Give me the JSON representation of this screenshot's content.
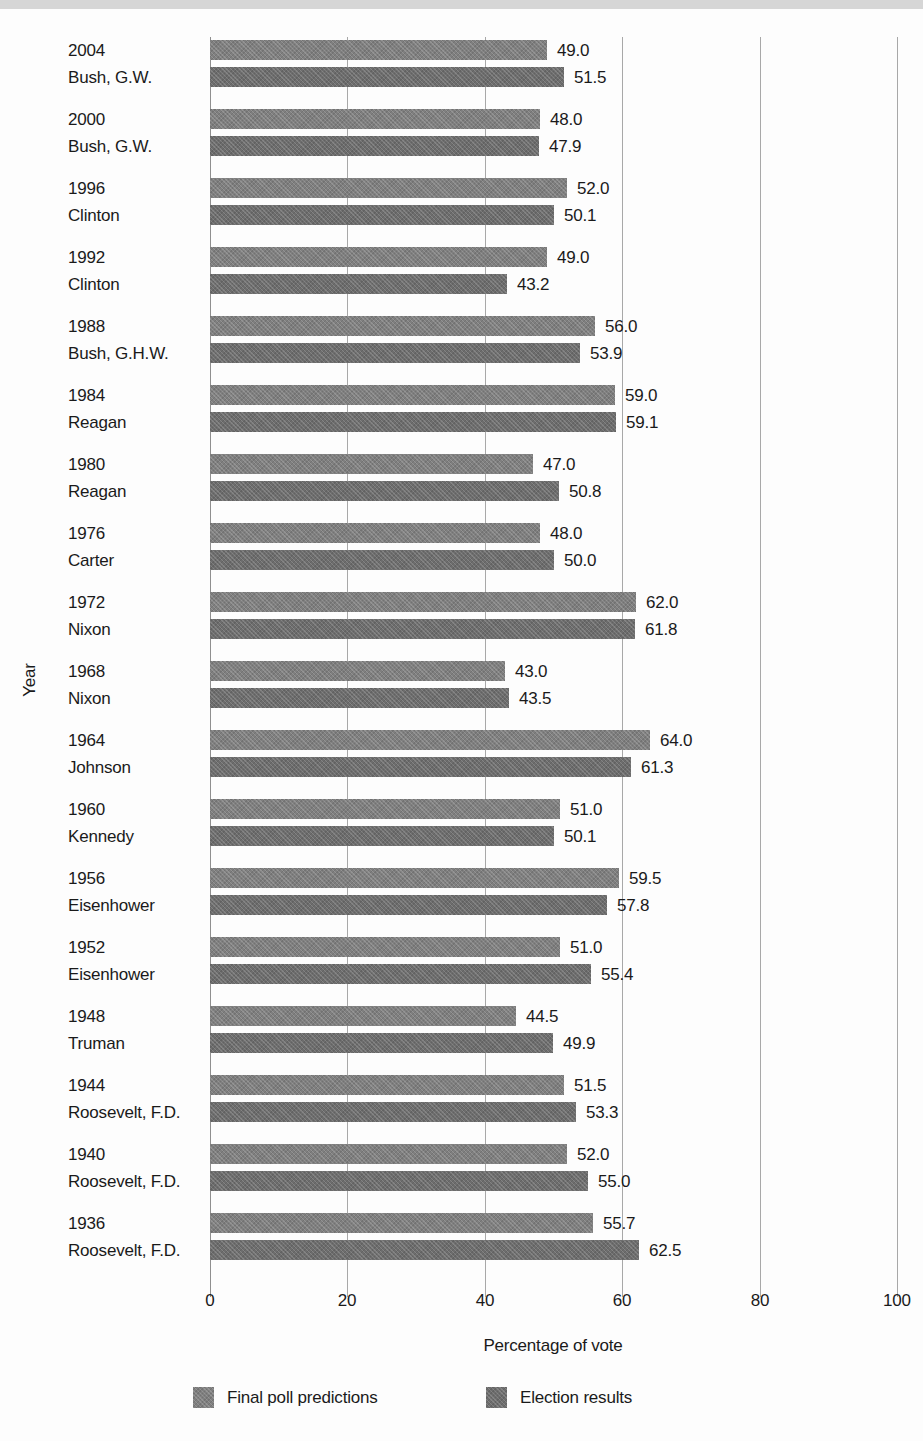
{
  "page": {
    "top_band_color": "#d6d6d6",
    "background_color": "#fdfdfd",
    "text_color": "#1a1a1a",
    "gridline_color": "#a8a8a8"
  },
  "chart_data": {
    "type": "bar",
    "orientation": "horizontal",
    "xlabel": "Percentage of vote",
    "ylabel": "Year",
    "xlim": [
      0,
      100
    ],
    "x_ticks": [
      "0",
      "20",
      "40",
      "60",
      "80",
      "100"
    ],
    "grid": "vertical-on",
    "legend_position": "bottom",
    "value_labels": "outside-end, one decimal",
    "series": [
      {
        "name": "Final poll predictions",
        "color": "#7f7f7f"
      },
      {
        "name": "Election results",
        "color": "#6d6d6d"
      }
    ],
    "groups": [
      {
        "year": "2004",
        "candidate": "Bush, G.W.",
        "poll": 49.0,
        "result": 51.5
      },
      {
        "year": "2000",
        "candidate": "Bush, G.W.",
        "poll": 48.0,
        "result": 47.9
      },
      {
        "year": "1996",
        "candidate": "Clinton",
        "poll": 52.0,
        "result": 50.1
      },
      {
        "year": "1992",
        "candidate": "Clinton",
        "poll": 49.0,
        "result": 43.2
      },
      {
        "year": "1988",
        "candidate": "Bush, G.H.W.",
        "poll": 56.0,
        "result": 53.9
      },
      {
        "year": "1984",
        "candidate": "Reagan",
        "poll": 59.0,
        "result": 59.1
      },
      {
        "year": "1980",
        "candidate": "Reagan",
        "poll": 47.0,
        "result": 50.8
      },
      {
        "year": "1976",
        "candidate": "Carter",
        "poll": 48.0,
        "result": 50.0
      },
      {
        "year": "1972",
        "candidate": "Nixon",
        "poll": 62.0,
        "result": 61.8
      },
      {
        "year": "1968",
        "candidate": "Nixon",
        "poll": 43.0,
        "result": 43.5
      },
      {
        "year": "1964",
        "candidate": "Johnson",
        "poll": 64.0,
        "result": 61.3
      },
      {
        "year": "1960",
        "candidate": "Kennedy",
        "poll": 51.0,
        "result": 50.1
      },
      {
        "year": "1956",
        "candidate": "Eisenhower",
        "poll": 59.5,
        "result": 57.8
      },
      {
        "year": "1952",
        "candidate": "Eisenhower",
        "poll": 51.0,
        "result": 55.4
      },
      {
        "year": "1948",
        "candidate": "Truman",
        "poll": 44.5,
        "result": 49.9
      },
      {
        "year": "1944",
        "candidate": "Roosevelt, F.D.",
        "poll": 51.5,
        "result": 53.3
      },
      {
        "year": "1940",
        "candidate": "Roosevelt, F.D.",
        "poll": 52.0,
        "result": 55.0
      },
      {
        "year": "1936",
        "candidate": "Roosevelt, F.D.",
        "poll": 55.7,
        "result": 62.5
      }
    ]
  }
}
